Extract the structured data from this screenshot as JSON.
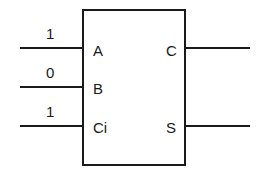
{
  "diagram": {
    "block": {
      "name": "full-adder"
    },
    "inputs": [
      {
        "pin": "A",
        "value": "1"
      },
      {
        "pin": "B",
        "value": "0"
      },
      {
        "pin": "Ci",
        "value": "1"
      }
    ],
    "outputs": [
      {
        "pin": "C"
      },
      {
        "pin": "S"
      }
    ],
    "colors": {
      "line": "#1a1a1a",
      "background": "#ffffff"
    }
  }
}
